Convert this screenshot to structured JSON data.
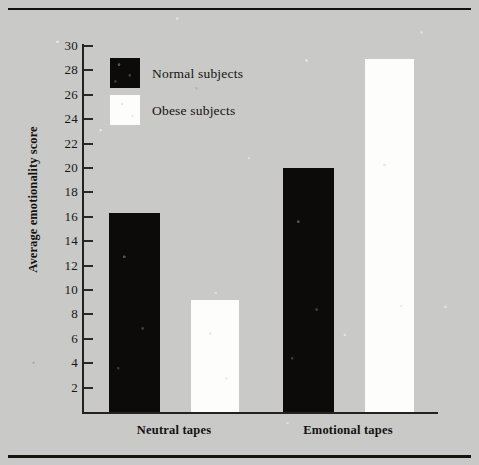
{
  "figure": {
    "background_color": "#c9c9c7",
    "rule_color": "#15140f"
  },
  "chart_data": {
    "type": "bar",
    "title": "",
    "xlabel": "",
    "ylabel": "Average emotionality score",
    "categories": [
      "Neutral tapes",
      "Emotional tapes"
    ],
    "series": [
      {
        "name": "Normal subjects",
        "color": "#0c0b0a",
        "values": [
          16.3,
          20.0
        ]
      },
      {
        "name": "Obese subjects",
        "color": "#fdfdfb",
        "values": [
          9.2,
          28.9
        ]
      }
    ],
    "ylim": [
      0,
      30
    ],
    "yticks": [
      2,
      4,
      6,
      8,
      10,
      12,
      14,
      16,
      18,
      20,
      22,
      24,
      26,
      28,
      30
    ],
    "ytick_labels": [
      "2",
      "4",
      "6",
      "8",
      "10",
      "12",
      "14",
      "16",
      "18",
      "20",
      "22",
      "24",
      "26",
      "28",
      "30"
    ],
    "grid": false,
    "legend_position": "upper-left",
    "legend_entries": [
      {
        "label": "Normal subjects",
        "color": "#0c0b0a"
      },
      {
        "label": "Obese subjects",
        "color": "#fdfdfb"
      }
    ]
  }
}
